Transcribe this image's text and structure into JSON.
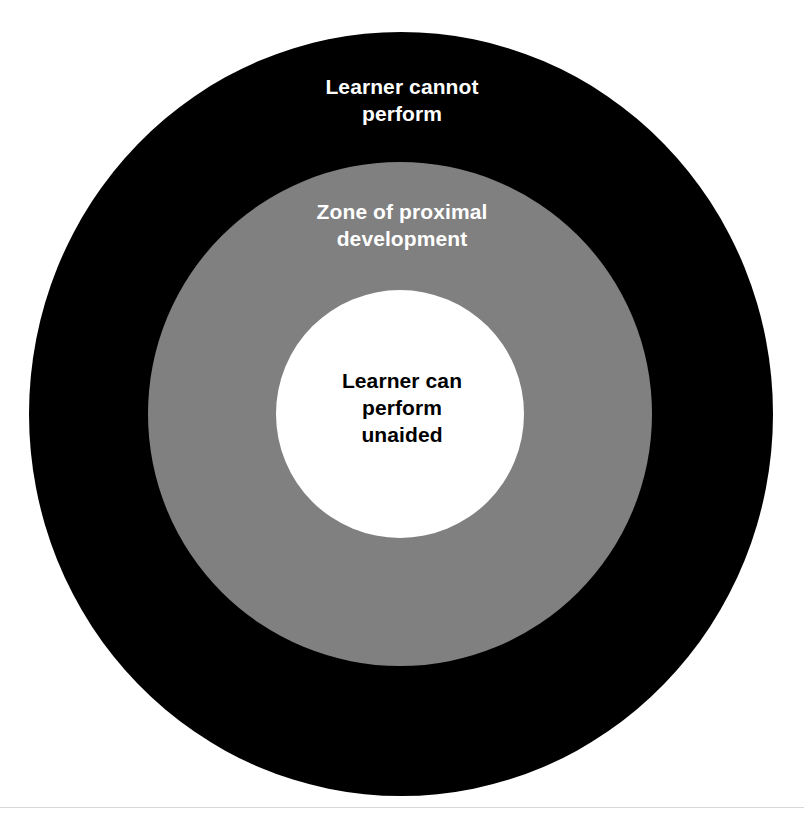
{
  "diagram": {
    "background_color": "#ffffff",
    "rings": [
      {
        "id": "outer",
        "label": "Learner cannot\nperform",
        "fill_color": "#000000",
        "text_color": "#ffffff"
      },
      {
        "id": "middle",
        "label": "Zone of proximal\ndevelopment",
        "fill_color": "#808080",
        "text_color": "#ffffff"
      },
      {
        "id": "inner",
        "label": "Learner can\nperform\nunaided",
        "fill_color": "#ffffff",
        "text_color": "#000000"
      }
    ]
  }
}
